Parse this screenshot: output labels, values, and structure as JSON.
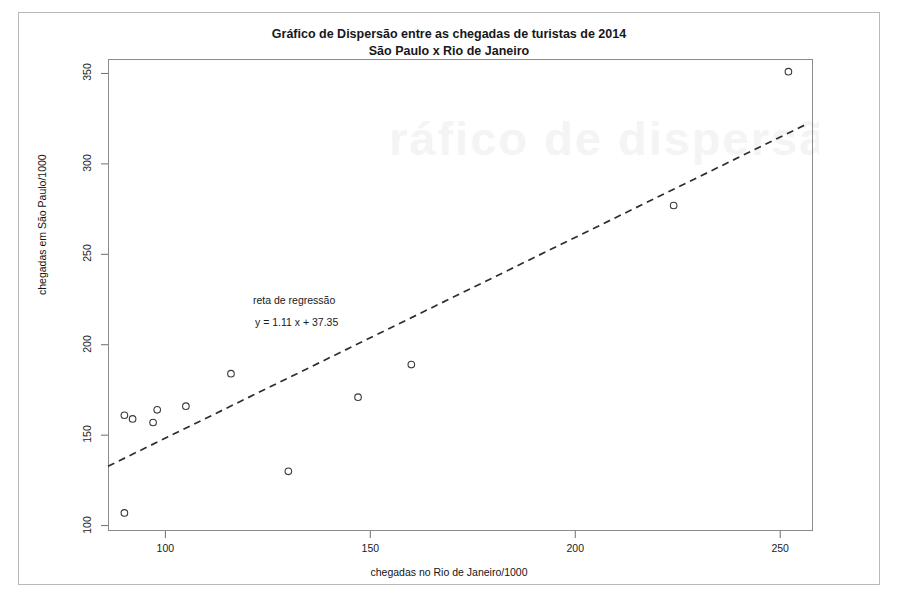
{
  "document": {
    "watermark_text": "ráfico de dispersã"
  },
  "title": {
    "line1": "Gráfico de Dispersão entre as chegadas de turistas de 2014",
    "line2": "São Paulo x Rio de Janeiro"
  },
  "annotation": {
    "label": "reta de regressão",
    "equation": "y =  1.11 x +   37.35"
  },
  "chart_data": {
    "type": "scatter",
    "xlabel": "chegadas no Rio de Janeiro/1000",
    "ylabel": "chegadas em São Paulo/1000",
    "xlim": [
      86,
      258
    ],
    "ylim": [
      97,
      358
    ],
    "xticks": [
      100,
      150,
      200,
      250
    ],
    "yticks": [
      100,
      150,
      200,
      250,
      300,
      350
    ],
    "grid": false,
    "legend": false,
    "point_color": "#3a3a3a",
    "point_marker": "open-circle",
    "points": [
      {
        "x": 90,
        "y": 161
      },
      {
        "x": 92,
        "y": 159
      },
      {
        "x": 90,
        "y": 107
      },
      {
        "x": 97,
        "y": 157
      },
      {
        "x": 98,
        "y": 164
      },
      {
        "x": 105,
        "y": 166
      },
      {
        "x": 116,
        "y": 184
      },
      {
        "x": 130,
        "y": 130
      },
      {
        "x": 147,
        "y": 171
      },
      {
        "x": 160,
        "y": 189
      },
      {
        "x": 224,
        "y": 277
      },
      {
        "x": 252,
        "y": 351
      }
    ],
    "regression": {
      "slope": 1.11,
      "intercept": 37.35,
      "style": "dashed",
      "color": "#2e2e2e",
      "label": "reta de regressão",
      "equation": "y =  1.11 x +   37.35",
      "x_start": 86,
      "x_end": 256
    }
  }
}
